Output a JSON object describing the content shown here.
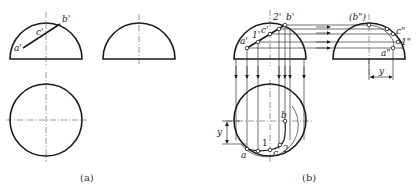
{
  "figure_a": {
    "caption": "(a)",
    "labels": {
      "a": "a'",
      "b": "b'",
      "c": "c'"
    }
  },
  "figure_b": {
    "caption": "(b)",
    "front_labels": {
      "a": "a'",
      "one": "1'",
      "c": "c'",
      "two": "2'",
      "b": "b'"
    },
    "side_labels": {
      "b": "(b\")",
      "c": "c\"",
      "one": "1\"",
      "a": "a\""
    },
    "side_dim": "y",
    "top_labels": {
      "a": "a",
      "one": "1",
      "c": "c",
      "two": "2",
      "b": "b"
    },
    "top_dim": "y"
  },
  "colors": {
    "line": "#1a1a1a",
    "background": "#ffffff"
  }
}
